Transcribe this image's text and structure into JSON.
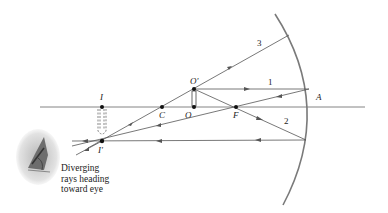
{
  "diagram": {
    "type": "ray-diagram-concave-mirror",
    "labels": {
      "image_top": "I",
      "image_tip": "I'",
      "center": "C",
      "object_base": "O",
      "object_tip": "O'",
      "focal_point": "F",
      "vertex": "A"
    },
    "ray_numbers": [
      "1",
      "2",
      "3"
    ],
    "caption_line1": "Diverging",
    "caption_line2": "rays heading",
    "caption_line3": "toward eye",
    "colors": {
      "line": "#555555",
      "mirror": "#777777",
      "points": "#111111"
    }
  }
}
